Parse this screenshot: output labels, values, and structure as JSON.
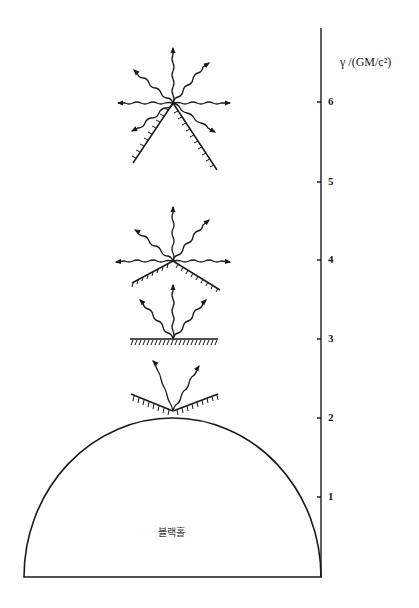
{
  "diagram": {
    "axis": {
      "title": "γ /(GM/c²)",
      "ticks": [
        {
          "value": "1",
          "y": 497
        },
        {
          "value": "2",
          "y": 418
        },
        {
          "value": "3",
          "y": 339
        },
        {
          "value": "4",
          "y": 260
        },
        {
          "value": "5",
          "y": 182
        },
        {
          "value": "6",
          "y": 102
        }
      ]
    },
    "black_hole": {
      "label": "블랙홀"
    },
    "emitters": [
      {
        "level": "6",
        "description": "emitter with 7 escaping photon paths, mirror tilted downward"
      },
      {
        "level": "4",
        "description": "emitter with 7 escaping photon paths, mirror tilted slightly down"
      },
      {
        "level": "3",
        "description": "emitter with 3 escaping photon paths, flat mirror"
      },
      {
        "level": "2",
        "description": "emitter with 2 escaping photon paths, mirror tilted upward"
      }
    ],
    "colors": {
      "ink": "#1a1a1a",
      "background": "#ffffff"
    }
  }
}
